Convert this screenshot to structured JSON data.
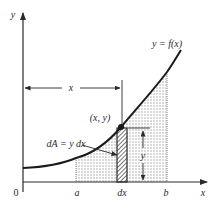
{
  "figure": {
    "type": "area-under-curve-diagram",
    "axes": {
      "y_axis_label": "y",
      "x_axis_label": "x",
      "origin_label": "0"
    },
    "curve": {
      "label": "y = f(x)"
    },
    "point": {
      "label": "(x, y)"
    },
    "x_distance": {
      "label": "x"
    },
    "strip": {
      "label": "dA = y dx",
      "width_label": "dx"
    },
    "height": {
      "label": "y"
    },
    "bounds": {
      "lower_label": "a",
      "upper_label": "b"
    },
    "colors": {
      "ink": "#2a2a2a",
      "shade": "#d6d6d6",
      "background": "#ffffff"
    }
  }
}
